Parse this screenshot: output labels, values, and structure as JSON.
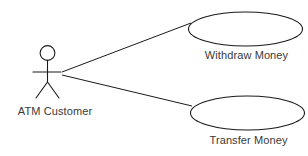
{
  "diagram": {
    "type": "uml-use-case-diagram",
    "background_color": "#ffffff",
    "stroke_color": "#1a1a1a",
    "text_color": "#3a3a3a",
    "actor": {
      "name": "actor",
      "label": "ATM Customer",
      "icon": "stick-figure-icon",
      "head": {
        "cx": 47.5,
        "cy": 53,
        "r": 7.5
      },
      "body": {
        "x": 47.5,
        "y1": 60.5,
        "y2": 82
      },
      "arms": {
        "y": 72,
        "x1": 33,
        "x2": 61
      },
      "legs": {
        "x": 47.5,
        "y_top": 82,
        "left_x": 36,
        "right_x": 59,
        "y_bottom": 98
      },
      "label_position": {
        "x": 55,
        "y": 112
      }
    },
    "use_cases": [
      {
        "name": "use-case-withdraw-money",
        "label": "Withdraw Money",
        "ellipse": {
          "cx": 245.5,
          "cy": 29,
          "rx": 57.5,
          "ry": 17
        },
        "label_position": {
          "x": 246,
          "y": 56
        }
      },
      {
        "name": "use-case-transfer-money",
        "label": "Transfer Money",
        "ellipse": {
          "cx": 247.5,
          "cy": 113,
          "rx": 57.5,
          "ry": 17
        },
        "label_position": {
          "x": 248,
          "y": 141
        }
      }
    ],
    "associations": [
      {
        "name": "association-actor-to-withdraw-money",
        "from": "actor",
        "to": "use-case-withdraw-money",
        "x1": 62,
        "y1": 72,
        "x2": 191,
        "y2": 23
      },
      {
        "name": "association-actor-to-transfer-money",
        "from": "actor",
        "to": "use-case-transfer-money",
        "x1": 62,
        "y1": 75,
        "x2": 192,
        "y2": 106
      }
    ]
  }
}
